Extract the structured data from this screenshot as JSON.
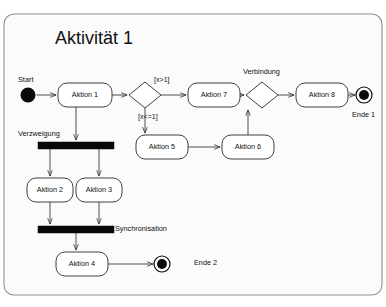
{
  "diagram": {
    "kind": "uml-activity-diagram",
    "title": "Aktivität 1",
    "language": "de",
    "frame": {
      "x": 4,
      "y": 14,
      "width": 378,
      "height": 281,
      "rx": 10
    },
    "colors": {
      "background": "#ffffff",
      "frame_fill": "#fbfbfb",
      "frame_stroke": "#8f8f8f",
      "node_fill": "#ffffff",
      "node_stroke": "#2b2b2b",
      "bar_fill": "#080808",
      "edge_stroke": "#3a3a3a",
      "text": "#111111"
    }
  },
  "title": {
    "text": "Aktivität 1",
    "x": 55,
    "y": 44
  },
  "annotations": [
    {
      "id": "anno-start",
      "text": "Start",
      "x": 18,
      "y": 82,
      "anchor": "start"
    },
    {
      "id": "anno-verzweigung",
      "text": "Verzweigung",
      "x": 18,
      "y": 136,
      "anchor": "start"
    },
    {
      "id": "anno-synchronisation",
      "text": "Synchronisation",
      "x": 115,
      "y": 231,
      "anchor": "start"
    },
    {
      "id": "anno-verbindung",
      "text": "Verbindung",
      "x": 243,
      "y": 74,
      "anchor": "start"
    },
    {
      "id": "anno-ende-1",
      "text": "Ende 1",
      "x": 352,
      "y": 117,
      "anchor": "start"
    },
    {
      "id": "anno-ende-2",
      "text": "Ende 2",
      "x": 194,
      "y": 265,
      "anchor": "start"
    }
  ],
  "guards": [
    {
      "id": "guard-gt",
      "text": "[x>1]",
      "x": 154,
      "y": 82,
      "anchor": "start"
    },
    {
      "id": "guard-lte",
      "text": "[x<=1]",
      "x": 138,
      "y": 119,
      "anchor": "start"
    }
  ],
  "nodes": {
    "start": {
      "id": "start-node",
      "type": "initial-node",
      "cx": 28,
      "cy": 95,
      "r": 7.5
    },
    "actions": [
      {
        "id": "aktion-1",
        "label": "Aktion 1",
        "x": 58,
        "y": 83,
        "w": 54,
        "h": 24,
        "rx": 9
      },
      {
        "id": "aktion-7",
        "label": "Aktion 7",
        "x": 188,
        "y": 83,
        "w": 52,
        "h": 24,
        "rx": 9
      },
      {
        "id": "aktion-8",
        "label": "Aktion 8",
        "x": 296,
        "y": 83,
        "w": 52,
        "h": 24,
        "rx": 9
      },
      {
        "id": "aktion-5",
        "label": "Aktion 5",
        "x": 136,
        "y": 135,
        "w": 52,
        "h": 24,
        "rx": 9
      },
      {
        "id": "aktion-6",
        "label": "Aktion 6",
        "x": 222,
        "y": 135,
        "w": 52,
        "h": 24,
        "rx": 9
      },
      {
        "id": "aktion-2",
        "label": "Aktion 2",
        "x": 27,
        "y": 178,
        "w": 46,
        "h": 24,
        "rx": 9
      },
      {
        "id": "aktion-3",
        "label": "Aktion 3",
        "x": 76,
        "y": 178,
        "w": 46,
        "h": 24,
        "rx": 9
      },
      {
        "id": "aktion-4",
        "label": "Aktion 4",
        "x": 56,
        "y": 252,
        "w": 52,
        "h": 24,
        "rx": 9
      }
    ],
    "decisions": [
      {
        "id": "decision-x",
        "cx": 145,
        "cy": 95,
        "rx": 16,
        "ry": 13
      },
      {
        "id": "merge-verbindung",
        "cx": 262,
        "cy": 95,
        "rx": 16,
        "ry": 13
      }
    ],
    "bars": [
      {
        "id": "fork-bar",
        "x": 38,
        "y": 142,
        "w": 76,
        "h": 7
      },
      {
        "id": "join-bar",
        "x": 38,
        "y": 226,
        "w": 76,
        "h": 7
      }
    ],
    "ends": [
      {
        "id": "ende-1",
        "label": "Ende 1",
        "cx": 364,
        "cy": 95,
        "r_outer": 8,
        "r_inner": 5
      },
      {
        "id": "ende-2",
        "label": "Ende 2",
        "cx": 162,
        "cy": 264,
        "r_outer": 8,
        "r_inner": 5
      }
    ]
  },
  "edges": [
    {
      "id": "edge-start-aktion1",
      "from": "start-node",
      "to": "aktion-1",
      "path": "M 36.5 95 L 56 95",
      "arrow": true
    },
    {
      "id": "edge-aktion1-decision",
      "from": "aktion-1",
      "to": "decision-x",
      "path": "M 112 95 L 127 95",
      "arrow": true
    },
    {
      "id": "edge-decision-aktion7",
      "from": "decision-x",
      "to": "aktion-7",
      "path": "M 161 95 L 186 95",
      "arrow": true,
      "guard": "[x>1]"
    },
    {
      "id": "edge-decision-aktion5",
      "from": "decision-x",
      "to": "aktion-5",
      "path": "M 145 108 L 145 133",
      "arrow": true,
      "guard": "[x<=1]"
    },
    {
      "id": "edge-aktion7-verbindung",
      "from": "aktion-7",
      "to": "merge-verbindung",
      "path": "M 240 95 L 244 95",
      "arrow": true
    },
    {
      "id": "edge-verbindung-aktion8",
      "from": "merge-verbindung",
      "to": "aktion-8",
      "path": "M 278 95 L 294 95",
      "arrow": true
    },
    {
      "id": "edge-aktion8-ende1",
      "from": "aktion-8",
      "to": "ende-1",
      "path": "M 348 95 L 355 95",
      "arrow": true
    },
    {
      "id": "edge-aktion5-aktion6",
      "from": "aktion-5",
      "to": "aktion-6",
      "path": "M 188 147 L 220 147",
      "arrow": true
    },
    {
      "id": "edge-aktion6-verbindung",
      "from": "aktion-6",
      "to": "merge-verbindung",
      "path": "M 248 135 L 248 110",
      "arrow": true
    },
    {
      "id": "edge-aktion1-fork",
      "from": "aktion-1",
      "to": "fork-bar",
      "path": "M 76 107 L 76 140",
      "arrow": true
    },
    {
      "id": "edge-fork-aktion2",
      "from": "fork-bar",
      "to": "aktion-2",
      "path": "M 50 149 L 50 176",
      "arrow": true
    },
    {
      "id": "edge-fork-aktion3",
      "from": "fork-bar",
      "to": "aktion-3",
      "path": "M 99 149 L 99 176",
      "arrow": true
    },
    {
      "id": "edge-aktion2-join",
      "from": "aktion-2",
      "to": "join-bar",
      "path": "M 50 202 L 50 224",
      "arrow": true
    },
    {
      "id": "edge-aktion3-join",
      "from": "aktion-3",
      "to": "join-bar",
      "path": "M 99 202 L 99 224",
      "arrow": true
    },
    {
      "id": "edge-join-aktion4",
      "from": "join-bar",
      "to": "aktion-4",
      "path": "M 76 233 L 76 250",
      "arrow": true
    },
    {
      "id": "edge-aktion4-ende2",
      "from": "aktion-4",
      "to": "ende-2",
      "path": "M 108 264 L 153 264",
      "arrow": true
    }
  ]
}
